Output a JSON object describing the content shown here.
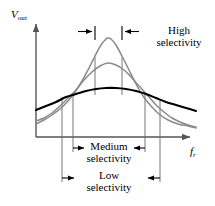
{
  "figure": {
    "axes": {
      "y_axis_label": "V",
      "y_axis_subscript": "out",
      "x_axis_label": "f",
      "x_axis_subscript": "r",
      "axis_color": "#555555",
      "origin": {
        "x": 36,
        "y": 137
      },
      "y_axis_top": {
        "x": 36,
        "y": 20
      },
      "x_axis_right": {
        "x": 196,
        "y": 137
      }
    },
    "annotations": {
      "high": {
        "line1": "High",
        "line2": "selectivity"
      },
      "medium": {
        "line1": "Medium",
        "line2": "selectivity"
      },
      "low": {
        "line1": "Low",
        "line2": "selectivity"
      }
    },
    "colors": {
      "curve_high": "#8a8a8a",
      "curve_medium": "#8a8a8a",
      "curve_low": "#000000",
      "axis": "#555555",
      "dropline": "#666666",
      "arrow": "#000000",
      "background": "#ffffff"
    }
  },
  "chart_data": {
    "type": "line",
    "title": "Selectivity",
    "xlabel": "f_r",
    "ylabel": "V_out",
    "grid": false,
    "legend": "none",
    "xlim": [
      36,
      196
    ],
    "ylim": [
      137,
      20
    ],
    "series": [
      {
        "name": "High selectivity",
        "color": "#8a8a8a",
        "peak_x": 108,
        "peak_y": 38,
        "bandwidth_marks_x": [
          95,
          122
        ],
        "droplines_x": [
          95,
          122
        ],
        "points": [
          [
            36,
            124
          ],
          [
            44,
            120
          ],
          [
            52,
            115
          ],
          [
            60,
            109
          ],
          [
            68,
            101
          ],
          [
            75,
            92
          ],
          [
            82,
            81
          ],
          [
            89,
            68
          ],
          [
            95,
            56
          ],
          [
            101,
            45
          ],
          [
            106,
            39
          ],
          [
            108,
            38
          ],
          [
            111,
            39
          ],
          [
            116,
            45
          ],
          [
            122,
            56
          ],
          [
            129,
            70
          ],
          [
            136,
            84
          ],
          [
            143,
            96
          ],
          [
            151,
            106
          ],
          [
            159,
            114
          ],
          [
            168,
            120
          ],
          [
            178,
            124
          ],
          [
            188,
            126
          ],
          [
            196,
            128
          ]
        ]
      },
      {
        "name": "Medium selectivity",
        "color": "#8a8a8a",
        "peak_x": 108,
        "peak_y": 63,
        "bandwidth_marks_x": [
          73,
          145
        ],
        "droplines_x": [
          73,
          145
        ],
        "points": [
          [
            36,
            121
          ],
          [
            44,
            118
          ],
          [
            52,
            113
          ],
          [
            60,
            106
          ],
          [
            68,
            98
          ],
          [
            76,
            90
          ],
          [
            84,
            80
          ],
          [
            92,
            72
          ],
          [
            100,
            66
          ],
          [
            108,
            63
          ],
          [
            116,
            65
          ],
          [
            124,
            70
          ],
          [
            132,
            78
          ],
          [
            140,
            87
          ],
          [
            148,
            96
          ],
          [
            156,
            105
          ],
          [
            164,
            112
          ],
          [
            172,
            118
          ],
          [
            180,
            122
          ],
          [
            188,
            125
          ],
          [
            196,
            127
          ]
        ]
      },
      {
        "name": "Low selectivity",
        "color": "#000000",
        "peak_x": 108,
        "peak_y": 88,
        "bandwidth_marks_x": [
          62,
          160
        ],
        "droplines_x": [
          62,
          160
        ],
        "points": [
          [
            36,
            110
          ],
          [
            46,
            106
          ],
          [
            56,
            102
          ],
          [
            66,
            97
          ],
          [
            76,
            94
          ],
          [
            86,
            91
          ],
          [
            96,
            89
          ],
          [
            106,
            88
          ],
          [
            116,
            88
          ],
          [
            126,
            89
          ],
          [
            136,
            91
          ],
          [
            146,
            94
          ],
          [
            156,
            98
          ],
          [
            166,
            102
          ],
          [
            176,
            105
          ],
          [
            186,
            108
          ],
          [
            196,
            111
          ]
        ]
      }
    ],
    "bandwidth_markers": [
      {
        "label": "High selectivity",
        "left_x": 95,
        "right_x": 122,
        "y": 31,
        "arrow_direction": "inward-from-outside"
      },
      {
        "label": "Medium selectivity",
        "left_x": 73,
        "right_x": 145,
        "y": 148,
        "arrow_direction": "inward"
      },
      {
        "label": "Low selectivity",
        "left_x": 62,
        "right_x": 160,
        "y": 178,
        "arrow_direction": "inward"
      }
    ]
  }
}
